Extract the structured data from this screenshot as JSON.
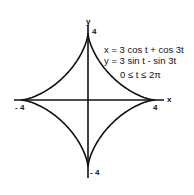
{
  "figure": {
    "equations": {
      "x": "x = 3 cos t + cos 3t",
      "y": "y = 3 sin t - sin 3t",
      "range": "0 ≤ t ≤ 2π"
    },
    "axes": {
      "x_label": "x",
      "y_label": "y",
      "ticks": {
        "x_pos": "4",
        "x_neg": "- 4",
        "y_pos": "4",
        "y_neg": "- 4"
      }
    },
    "curve": "astroid (hypocycloid with four cusps)",
    "colors": {
      "stroke": "#111111",
      "background": "#ffffff"
    }
  }
}
